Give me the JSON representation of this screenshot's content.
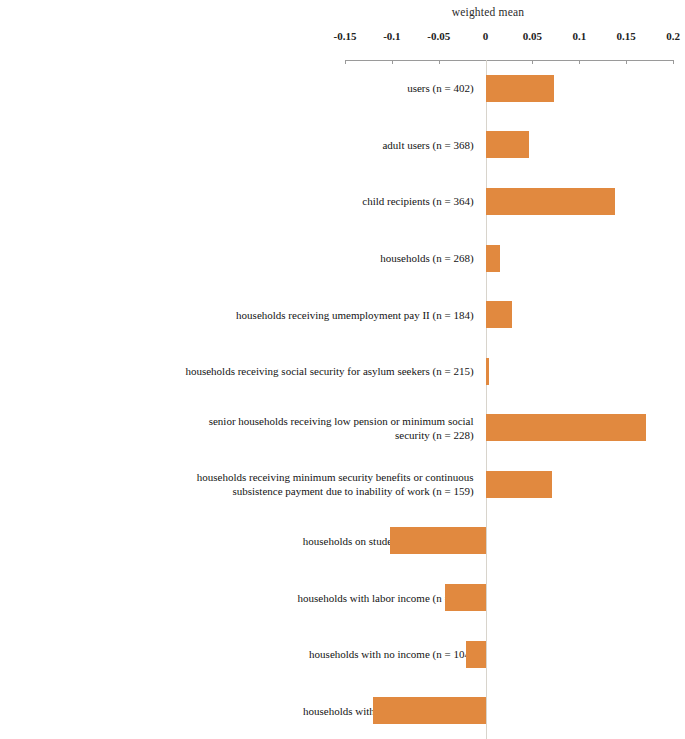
{
  "chart_data": {
    "type": "bar",
    "orientation": "horizontal",
    "title": "weighted mean",
    "xlabel": "weighted mean",
    "ylabel": "",
    "xlim": [
      -0.15,
      0.2
    ],
    "xticks": [
      -0.15,
      -0.1,
      -0.05,
      0,
      0.05,
      0.1,
      0.15,
      0.2
    ],
    "xticklabels": [
      "-0.15",
      "-0.1",
      "-0.05",
      "0",
      "0.05",
      "0.1",
      "0.15",
      "0.2"
    ],
    "grid": false,
    "legend": null,
    "bar_color": "#e1893f",
    "categories": [
      "users (n = 402)",
      "adult users (n = 368)",
      "child recipients (n = 364)",
      "households (n = 268)",
      "households receiving umemployment pay II (n = 184)",
      "households receiving social security for asylum seekers (n = 215)",
      "senior households receiving low pension or minimum social\nsecurity (n = 228)",
      "households receiving minimum security benefits or continuous\nsubsistence payment due to inability of work (n = 159)",
      "households on student grants (n = 115)",
      "households with labor income (n = 126)",
      "households with no income (n = 104)",
      "households with other income (n = 69)"
    ],
    "values": [
      0.073,
      0.046,
      0.138,
      0.015,
      0.028,
      0.004,
      0.171,
      0.071,
      -0.102,
      -0.043,
      -0.021,
      -0.12
    ]
  }
}
